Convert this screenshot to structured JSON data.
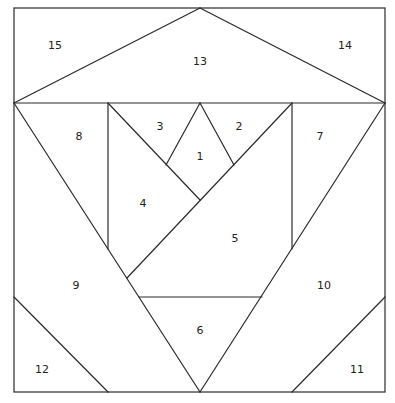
{
  "diagram": {
    "type": "foundation paper piecing pattern",
    "outline": {
      "x1": 14,
      "y1": 8,
      "x2": 385,
      "y2": 392
    },
    "line_color": "#2a2a2a",
    "background": "#ffffff",
    "pieces": [
      {
        "id": "p1",
        "label": "1",
        "x": 200,
        "y": 157
      },
      {
        "id": "p2",
        "label": "2",
        "x": 239,
        "y": 127
      },
      {
        "id": "p3",
        "label": "3",
        "x": 160,
        "y": 127
      },
      {
        "id": "p4",
        "label": "4",
        "x": 143,
        "y": 204
      },
      {
        "id": "p5",
        "label": "5",
        "x": 235,
        "y": 239
      },
      {
        "id": "p6",
        "label": "6",
        "x": 200,
        "y": 331
      },
      {
        "id": "p7",
        "label": "7",
        "x": 320,
        "y": 137
      },
      {
        "id": "p8",
        "label": "8",
        "x": 79,
        "y": 137
      },
      {
        "id": "p9",
        "label": "9",
        "x": 76,
        "y": 286
      },
      {
        "id": "p10",
        "label": "10",
        "x": 324,
        "y": 286
      },
      {
        "id": "p11",
        "label": "11",
        "x": 357,
        "y": 370
      },
      {
        "id": "p12",
        "label": "12",
        "x": 42,
        "y": 370
      },
      {
        "id": "p13",
        "label": "13",
        "x": 200,
        "y": 62
      },
      {
        "id": "p14",
        "label": "14",
        "x": 345,
        "y": 46
      },
      {
        "id": "p15",
        "label": "15",
        "x": 55,
        "y": 46
      }
    ]
  }
}
